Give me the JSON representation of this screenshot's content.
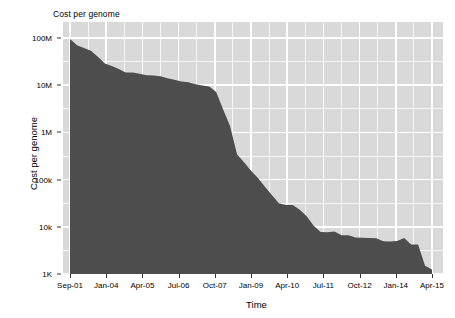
{
  "chart_data": {
    "type": "area",
    "title": "Cost per genome",
    "xlabel": "Time",
    "ylabel": "Cost per genome",
    "yscale": "log",
    "ylim": [
      1000,
      100000000
    ],
    "grid": true,
    "legend": null,
    "y_tick_labels": [
      "100M",
      "10M",
      "1M",
      "100k",
      "10k",
      "1K"
    ],
    "y_tick_values": [
      100000000,
      10000000,
      1000000,
      100000,
      10000,
      1000
    ],
    "x_tick_labels": [
      "Sep-01",
      "Jan-04",
      "Apr-05",
      "Jul-06",
      "Oct-07",
      "Jan-09",
      "Apr-10",
      "Jul-11",
      "Oct-12",
      "Jan-14",
      "Apr-15"
    ],
    "series_name": "Cost per genome",
    "fill_color": "#4d4d4d",
    "panel_color": "#d9d9d9",
    "grid_color": "#ffffff",
    "x": [
      "Sep-01",
      "Mar-02",
      "Sep-02",
      "Mar-03",
      "Oct-03",
      "Jan-04",
      "Apr-04",
      "Jul-04",
      "Oct-04",
      "Jan-05",
      "Apr-05",
      "Jul-05",
      "Oct-05",
      "Jan-06",
      "Apr-06",
      "Jul-06",
      "Oct-06",
      "Jan-07",
      "Apr-07",
      "Jul-07",
      "Oct-07",
      "Jan-08",
      "Apr-08",
      "Jul-08",
      "Oct-08",
      "Jan-09",
      "Apr-09",
      "Jul-09",
      "Oct-09",
      "Jan-10",
      "Apr-10",
      "Jul-10",
      "Oct-10",
      "Jan-11",
      "Apr-11",
      "Jul-11",
      "Oct-11",
      "Jan-12",
      "Apr-12",
      "Jul-12",
      "Oct-12",
      "Jan-13",
      "Apr-13",
      "Jul-13",
      "Oct-13",
      "Jan-14",
      "Apr-14",
      "Jul-14",
      "Oct-14",
      "Jan-15",
      "Apr-15",
      "Jul-15",
      "Oct-15"
    ],
    "values": [
      95263072,
      70175437,
      61448422,
      53751684,
      40157554,
      28780376,
      25670000,
      22000000,
      18519312,
      18519312,
      17500000,
      16300000,
      16000000,
      15500000,
      14000000,
      13000000,
      12000000,
      11500000,
      10500000,
      9900000,
      9400000,
      7147571,
      3063820,
      1352982,
      340000,
      232735,
      154714,
      108065,
      70333,
      47000,
      31512,
      29092,
      29000,
      23000,
      16712,
      10497,
      7743,
      7666,
      7950,
      6618,
      6600,
      5901,
      5826,
      5800,
      5700,
      4920,
      4905,
      5000,
      5800,
      4200,
      4211,
      1500,
      1245
    ]
  }
}
